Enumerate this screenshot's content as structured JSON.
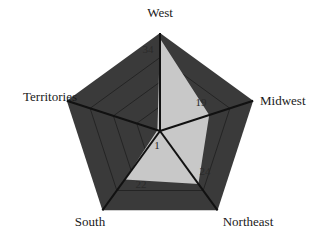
{
  "chart_data": {
    "type": "radar",
    "title": "",
    "categories": [
      "West",
      "Midwest",
      "Northeast",
      "South",
      "Territories"
    ],
    "series": [
      {
        "name": "Region",
        "values": [
          34,
          19,
          24,
          22,
          1
        ]
      }
    ],
    "value_labels": [
      "34",
      "19",
      "24",
      "22",
      "1"
    ],
    "rmax": 36,
    "grid_rings": 4,
    "grid": true,
    "legend": "none"
  },
  "colors": {
    "background_fill": "#3a3a3a",
    "data_fill": "#c8c8c8",
    "axis_line": "#111111",
    "grid_line": "#1e1e1e"
  }
}
